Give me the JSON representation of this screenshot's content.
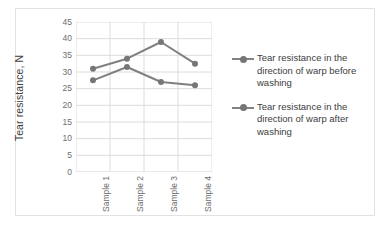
{
  "chart_data": {
    "type": "line",
    "title": "",
    "xlabel": "",
    "ylabel": "Tear resistance, N",
    "categories": [
      "Sample 1",
      "Sample 2",
      "Sample 3",
      "Sample 4"
    ],
    "ylim": [
      0,
      45
    ],
    "ytick_step": 5,
    "yticks": [
      45,
      40,
      35,
      30,
      25,
      20,
      15,
      10,
      5,
      0
    ],
    "grid": "both",
    "legend_position": "right",
    "series": [
      {
        "name": "Tear resistance  in the direction of warp before washing",
        "values": [
          31,
          34,
          39,
          32.5
        ],
        "color": "#808080"
      },
      {
        "name": "Tear resistance in the direction of warp after washing",
        "values": [
          27.5,
          31.5,
          27,
          26
        ],
        "color": "#808080"
      }
    ]
  },
  "legend": {
    "entries": [
      {
        "label": "Tear resistance  in the direction of warp before washing"
      },
      {
        "label": "Tear resistance in the direction of warp after washing"
      }
    ]
  },
  "colors": {
    "series_line": "#808080",
    "marker": "#767676",
    "gridline": "#dcdcdc",
    "axis_line": "#d2d2d2",
    "border": "#e2e2e2",
    "tick_text": "#6e6e6e",
    "title_text": "#3d3d3d"
  }
}
